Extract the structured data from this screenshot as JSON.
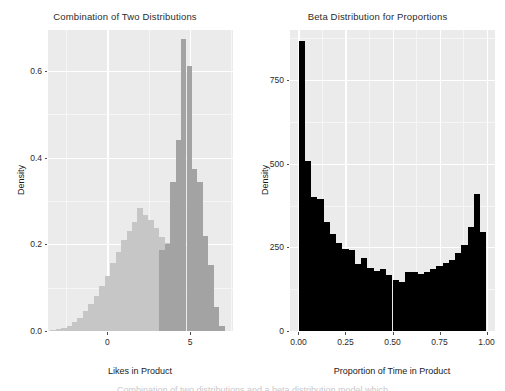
{
  "figure": {
    "background": "#ffffff",
    "panel_background": "#ebebeb",
    "gridline_color": "#ffffff",
    "text_color": "#2b2b2b"
  },
  "chart_data": [
    {
      "id": "combination-of-two-distributions",
      "type": "bar",
      "title": "Combination of Two Distributions",
      "xlabel": "Likes in Product",
      "ylabel": "Density",
      "xlim": [
        -3.6,
        7.6
      ],
      "ylim": [
        0,
        0.695
      ],
      "xticks": [
        "0",
        "5"
      ],
      "xtick_values": [
        0,
        5
      ],
      "yticks": [
        "0.0",
        "0.2",
        "0.4",
        "0.6"
      ],
      "ytick_values": [
        0.0,
        0.2,
        0.4,
        0.6
      ],
      "grid": true,
      "legend": "none",
      "binwidth": 0.33,
      "series": [
        {
          "name": "Broad distribution",
          "color": "#c6c6c6",
          "opacity": 1,
          "x": [
            -3.3,
            -2.97,
            -2.64,
            -2.31,
            -1.98,
            -1.65,
            -1.32,
            -0.99,
            -0.66,
            -0.33,
            0,
            0.33,
            0.66,
            0.99,
            1.32,
            1.65,
            1.98,
            2.31,
            2.64,
            2.97,
            3.3,
            3.63,
            3.96,
            4.29,
            4.62,
            4.95,
            5.28,
            5.61,
            5.94,
            6.27,
            6.6,
            6.93
          ],
          "values": [
            0.002,
            0.004,
            0.007,
            0.012,
            0.02,
            0.031,
            0.046,
            0.062,
            0.082,
            0.103,
            0.128,
            0.157,
            0.182,
            0.21,
            0.232,
            0.252,
            0.283,
            0.268,
            0.256,
            0.237,
            0.218,
            0.204,
            0.192,
            0.167,
            0.146,
            0.124,
            0.098,
            0.072,
            0.05,
            0.032,
            0.018,
            0.009
          ]
        },
        {
          "name": "Narrow distribution",
          "color": "#a3a3a3",
          "opacity": 1,
          "x": [
            3.3,
            3.63,
            3.96,
            4.29,
            4.62,
            4.95,
            5.28,
            5.61,
            5.94,
            6.27,
            6.6,
            6.93
          ],
          "values": [
            0.187,
            0.2,
            0.345,
            0.44,
            0.675,
            0.612,
            0.374,
            0.345,
            0.22,
            0.152,
            0.055,
            0.012
          ]
        }
      ]
    },
    {
      "id": "beta-distribution-for-proportions",
      "type": "bar",
      "title": "Beta Distribution for Proportions",
      "xlabel": "Proportion of Time in Product",
      "ylabel": "Density",
      "xlim": [
        -0.045,
        1.045
      ],
      "ylim": [
        0,
        900
      ],
      "xticks": [
        "0.00",
        "0.25",
        "0.50",
        "0.75",
        "1.00"
      ],
      "xtick_values": [
        0.0,
        0.25,
        0.5,
        0.75,
        1.0
      ],
      "yticks": [
        "0",
        "250",
        "500",
        "750"
      ],
      "ytick_values": [
        0,
        250,
        500,
        750
      ],
      "grid": true,
      "legend": "none",
      "binwidth": 0.0333,
      "series": [
        {
          "name": "Beta samples",
          "color": "#000000",
          "opacity": 1,
          "x": [
            0.017,
            0.05,
            0.083,
            0.117,
            0.15,
            0.183,
            0.217,
            0.25,
            0.283,
            0.317,
            0.35,
            0.383,
            0.417,
            0.45,
            0.483,
            0.517,
            0.55,
            0.583,
            0.617,
            0.65,
            0.683,
            0.717,
            0.75,
            0.783,
            0.817,
            0.85,
            0.883,
            0.917,
            0.95,
            0.983
          ],
          "values": [
            868,
            508,
            402,
            395,
            325,
            290,
            263,
            245,
            243,
            200,
            218,
            188,
            180,
            186,
            166,
            152,
            148,
            175,
            176,
            170,
            176,
            184,
            194,
            203,
            212,
            233,
            258,
            310,
            410,
            295
          ]
        }
      ]
    }
  ],
  "caption": {
    "text": "Combination of two distributions and a beta distribution model which"
  }
}
